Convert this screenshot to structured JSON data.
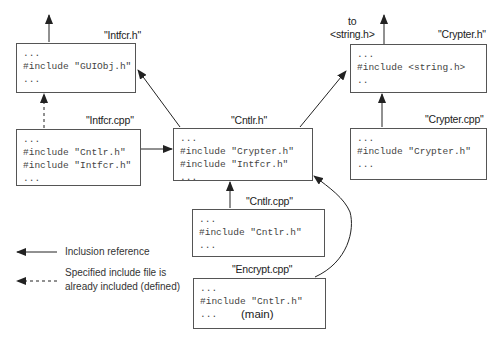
{
  "files": {
    "intfcr_h": {
      "name": "\"Intfcr.h\"",
      "lines": [
        "...",
        "#include \"GUIObj.h\"",
        "..."
      ]
    },
    "intfcr_cpp": {
      "name": "\"Intfcr.cpp\"",
      "lines": [
        "...",
        "#include \"Cntlr.h\"",
        "#include \"Intfcr.h\"",
        "..."
      ]
    },
    "cntlr_h": {
      "name": "\"Cntlr.h\"",
      "lines": [
        "...",
        "#include \"Crypter.h\"",
        "#include \"Intfcr.h\"",
        "..."
      ]
    },
    "crypter_h": {
      "name": "\"Crypter.h\"",
      "lines": [
        "...",
        "#include <string.h>",
        ".."
      ]
    },
    "crypter_cpp": {
      "name": "\"Crypter.cpp\"",
      "lines": [
        "...",
        "#include \"Crypter.h\"",
        "..."
      ]
    },
    "cntlr_cpp": {
      "name": "\"Cntlr.cpp\"",
      "lines": [
        "...",
        "#include \"Cntlr.h\"",
        "..."
      ]
    },
    "encrypt_cpp": {
      "name": "\"Encrypt.cpp\"",
      "lines": [
        "...",
        "#include \"Cntlr.h\"",
        "..."
      ],
      "tag": "(main)"
    }
  },
  "external": {
    "to_label": "to",
    "string_h": "<string.h>"
  },
  "legend": {
    "solid": "Inclusion reference",
    "dashed_line1": "Specified include file is",
    "dashed_line2": "already included (defined)"
  },
  "colors": {
    "line": "#222222",
    "box_border": "#555555",
    "code_text": "#444444"
  }
}
